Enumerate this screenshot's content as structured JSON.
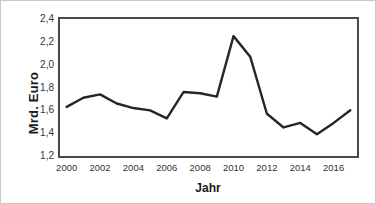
{
  "chart_data": {
    "type": "line",
    "title": "",
    "xlabel": "Jahr",
    "ylabel": "Mrd. Euro",
    "x": [
      2000,
      2001,
      2002,
      2003,
      2004,
      2005,
      2006,
      2007,
      2008,
      2009,
      2010,
      2011,
      2012,
      2013,
      2014,
      2015,
      2016,
      2017
    ],
    "values": [
      1.63,
      1.71,
      1.74,
      1.66,
      1.62,
      1.6,
      1.53,
      1.76,
      1.75,
      1.72,
      2.25,
      2.07,
      1.57,
      1.45,
      1.49,
      1.39,
      1.49,
      1.6
    ],
    "series": [
      {
        "name": "Mrd. Euro",
        "values": [
          1.63,
          1.71,
          1.74,
          1.66,
          1.62,
          1.6,
          1.53,
          1.76,
          1.75,
          1.72,
          2.25,
          2.07,
          1.57,
          1.45,
          1.49,
          1.39,
          1.49,
          1.6
        ]
      }
    ],
    "xlim": [
      1999.6,
      2017.4
    ],
    "ylim": [
      1.2,
      2.4
    ],
    "ytick_values": [
      1.2,
      1.4,
      1.6,
      1.8,
      2.0,
      2.2,
      2.4
    ],
    "ytick_labels": [
      "1,2",
      "1,4",
      "1,6",
      "1,8",
      "2,0",
      "2,2",
      "2,4"
    ],
    "xtick_values": [
      2000,
      2002,
      2004,
      2006,
      2008,
      2010,
      2012,
      2014,
      2016
    ],
    "xtick_labels": [
      "2000",
      "2002",
      "2004",
      "2006",
      "2008",
      "2010",
      "2012",
      "2014",
      "2016"
    ],
    "grid": false,
    "legend": false,
    "line_color": "#262626",
    "line_width": 2.4,
    "frame_color": "#4a4a4a",
    "background_color": "#ffffff"
  }
}
